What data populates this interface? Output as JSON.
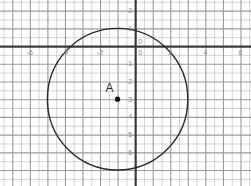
{
  "chart_data": {
    "type": "scatter",
    "title": "",
    "xlabel": "",
    "ylabel": "",
    "xlim": [
      -7.7,
      6.6
    ],
    "ylim": [
      -7.9,
      2.6
    ],
    "grid": true,
    "minor_grid_step": 0.5,
    "major_grid_step": 1,
    "legend": "none",
    "x_tick_labels": [
      "-6",
      "-4",
      "-2",
      "0",
      "2",
      "4",
      "6"
    ],
    "x_tick_values": [
      -6,
      -4,
      -2,
      0,
      2,
      4,
      6
    ],
    "y_tick_labels": [
      "2",
      "1",
      "0",
      "1",
      "2",
      "3",
      "4",
      "5",
      "6"
    ],
    "y_tick_values": [
      2,
      1,
      0,
      -1,
      -2,
      -3,
      -4,
      -5,
      -6
    ],
    "points": [
      {
        "name": "A",
        "label": "A",
        "x": -1,
        "y": -3
      }
    ],
    "shapes": [
      {
        "type": "circle",
        "center_x": -1,
        "center_y": -3,
        "radius": 4
      }
    ],
    "colors": {
      "minor_grid": "#c9c9c9",
      "major_grid": "#9a9a9a",
      "axis": "#3a3a3a",
      "curve": "#2b2b2b",
      "point": "#111111",
      "tick_text": "#8a8a8a",
      "background": "#ffffff"
    }
  },
  "figure": {
    "name": "coordinate-plane-with-circle",
    "point_a_label": "A"
  }
}
